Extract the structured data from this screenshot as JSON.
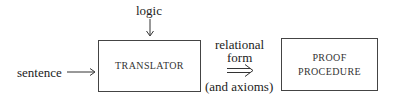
{
  "diagram": {
    "inputs": {
      "logic": "logic",
      "sentence": "sentence"
    },
    "nodes": [
      {
        "id": "translator",
        "label_lines": [
          "TRANSLATOR"
        ]
      },
      {
        "id": "proof-procedure",
        "label_lines": [
          "PROOF",
          "PROCEDURE"
        ]
      }
    ],
    "edge_label": {
      "line1": "relational",
      "line2": "form",
      "line3": "(and axioms)"
    },
    "edges": [
      {
        "from": "logic",
        "to": "translator",
        "style": "single-arrow"
      },
      {
        "from": "sentence",
        "to": "translator",
        "style": "single-arrow"
      },
      {
        "from": "translator",
        "to": "proof-procedure",
        "style": "double-arrow"
      }
    ],
    "colors": {
      "line": "#444444",
      "text": "#222222",
      "background": "#ffffff"
    }
  }
}
